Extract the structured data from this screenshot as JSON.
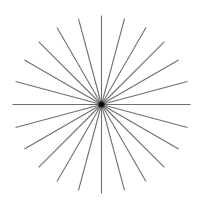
{
  "figure": {
    "type": "radial-starburst",
    "width": 209,
    "height": 204,
    "background": "#ffffff",
    "center": {
      "x": 101.5,
      "y": 104.5
    },
    "radius": 89,
    "line_count": 24,
    "angle_step_deg": 15,
    "line_color": "#6e6e6e",
    "line_width": 1.1,
    "center_dot": {
      "radius": 3.6,
      "color": "#111111"
    }
  }
}
